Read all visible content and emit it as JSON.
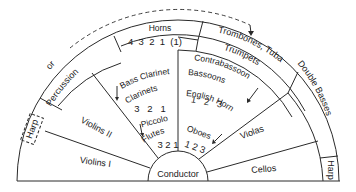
{
  "sections": {
    "conductor": "Conductor",
    "violins_1": "Violins I",
    "violins_2": "Violins II",
    "violas": "Violas",
    "cellos": "Cellos",
    "double_basses": "Double Basses",
    "harp_left": "Harp",
    "harp_right": "Harp",
    "percussion": "Percussion",
    "or_label": "or",
    "horns": "Horns",
    "horns_numbers": "4  3  2  1  (1)",
    "trombones_tuba": "Trombones, Tuba",
    "trumpets": "Trumpets",
    "bass_clarinet": "Bass Clarinet",
    "clarinets": "Clarinets",
    "clarinet_numbers": "3   2   1",
    "piccolo": "Piccolo",
    "flutes": "Flutes",
    "flute_numbers": "3 2 1",
    "contrabassoon": "Contrabassoon",
    "bassoons": "Bassoons",
    "bassoon_numbers": "1   2   3",
    "english_horn": "English Horn",
    "oboes": "Oboes",
    "oboe_numbers": "1 2 3"
  },
  "colors": {
    "ink": "#2a2a2a",
    "background": "#ffffff"
  }
}
